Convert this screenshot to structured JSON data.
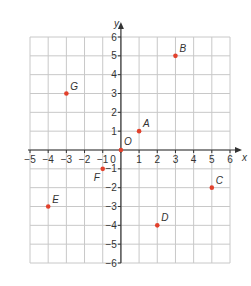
{
  "chart_data": {
    "type": "scatter",
    "title": "",
    "xlabel": "x",
    "ylabel": "y",
    "xlim": [
      -5,
      6
    ],
    "ylim": [
      -6,
      6
    ],
    "grid": true,
    "x_ticks": [
      -5,
      -4,
      -3,
      -2,
      -1,
      0,
      1,
      2,
      3,
      4,
      5,
      6
    ],
    "y_ticks": [
      -6,
      -5,
      -4,
      -3,
      -2,
      -1,
      1,
      2,
      3,
      4,
      5,
      6
    ],
    "origin_label": "0",
    "point_color": "#e2412c",
    "points": [
      {
        "label": "A",
        "x": 1,
        "y": 1
      },
      {
        "label": "B",
        "x": 3,
        "y": 5
      },
      {
        "label": "C",
        "x": 5,
        "y": -2
      },
      {
        "label": "D",
        "x": 2,
        "y": -4
      },
      {
        "label": "E",
        "x": -4,
        "y": -3
      },
      {
        "label": "F",
        "x": -1,
        "y": -1
      },
      {
        "label": "G",
        "x": -3,
        "y": 3
      },
      {
        "label": "O",
        "x": 0,
        "y": 0
      }
    ]
  },
  "colors": {
    "grid": "#c8c8c8",
    "axis": "#333333",
    "point": "#e2412c"
  }
}
